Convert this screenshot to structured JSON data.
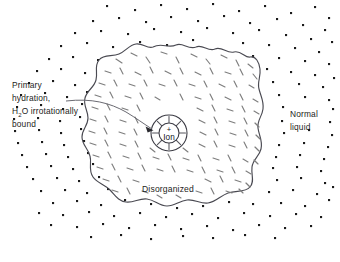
{
  "figure": {
    "background_color": "#ffffff",
    "width": 340,
    "height": 262
  },
  "labels": {
    "primary_hydration": {
      "line1": "Primary",
      "line2": "hydration,",
      "line3_pre": "H",
      "line3_sub": "2",
      "line3_post": "O irrotationally",
      "line4": "bound",
      "x": 12,
      "y": 88
    },
    "normal_liquid": {
      "line1": "Normal",
      "line2": "liquid",
      "x": 290,
      "y": 114
    },
    "disorganized": {
      "text": "Disorganized",
      "x": 168,
      "y": 192
    },
    "ion": {
      "charge": "+",
      "text": "Ion",
      "cx": 169,
      "cy": 133
    }
  },
  "regions": {
    "normal_liquid_region": {
      "name": "normal-liquid-dot-field",
      "marker": "dot",
      "marker_color": "#1a1a1a",
      "description": "Field of discrete dots representing normal bulk liquid water"
    },
    "disorganized_region": {
      "name": "disorganized-dash-field",
      "marker": "dash",
      "marker_color": "#7e7e7e",
      "description": "Field of short randomly oriented dashes representing disorganized water"
    },
    "primary_hydration_shell": {
      "name": "primary-hydration-shell",
      "outer_radius": 18,
      "inner_radius": 10,
      "spoke_count": 8,
      "description": "Annulus with radial spokes representing irrotationally bound water"
    }
  },
  "colors": {
    "ink": "#1d1d22",
    "outline": "#4a4a52",
    "dash": "#7e7e7e",
    "dot": "#1a1a1a",
    "background": "#ffffff"
  }
}
